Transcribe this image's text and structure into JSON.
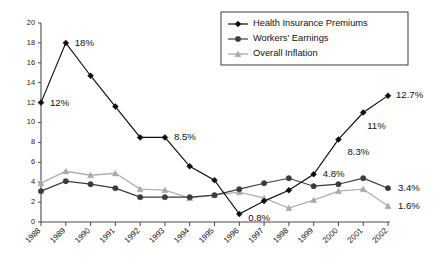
{
  "chart_data": {
    "type": "line",
    "title": "",
    "xlabel": "",
    "ylabel": "",
    "ylim": [
      0,
      20
    ],
    "ytick_step": 2,
    "grid": false,
    "legend_position": "top-right",
    "categories": [
      "1988",
      "1989",
      "1990",
      "1991",
      "1992",
      "1993",
      "1994",
      "1995",
      "1996",
      "1997",
      "1998",
      "1999",
      "2000",
      "2001",
      "2002"
    ],
    "yticks": [
      "0",
      "2",
      "4",
      "6",
      "8",
      "10",
      "12",
      "14",
      "16",
      "18",
      "20"
    ],
    "series": [
      {
        "name": "Health Insurance Premiums",
        "marker": "diamond",
        "color": "#0d0d0d",
        "values": [
          12,
          18,
          14.7,
          11.6,
          8.5,
          8.5,
          5.6,
          4.2,
          0.8,
          2.1,
          3.2,
          4.8,
          8.3,
          11,
          12.7
        ],
        "labels": [
          {
            "category": "1988",
            "value": 12,
            "text": "12%"
          },
          {
            "category": "1989",
            "value": 18,
            "text": "18%"
          },
          {
            "category": "1993",
            "value": 8.5,
            "text": "8.5%"
          },
          {
            "category": "1996",
            "value": 0.8,
            "text": "0.8%"
          },
          {
            "category": "1999",
            "value": 4.8,
            "text": "4.8%"
          },
          {
            "category": "2000",
            "value": 8.3,
            "text": "8.3%"
          },
          {
            "category": "2001",
            "value": 11,
            "text": "11%"
          },
          {
            "category": "2002",
            "value": 12.7,
            "text": "12.7%"
          }
        ]
      },
      {
        "name": "Workers' Earnings",
        "marker": "circle",
        "color": "#3b3b3b",
        "values": [
          3.1,
          4.1,
          3.8,
          3.4,
          2.5,
          2.5,
          2.5,
          2.7,
          3.3,
          3.9,
          4.4,
          3.6,
          3.8,
          4.4,
          3.4
        ],
        "labels": [
          {
            "category": "2002",
            "value": 3.4,
            "text": "3.4%"
          }
        ]
      },
      {
        "name": "Overall Inflation",
        "marker": "triangle",
        "color": "#a8a8a8",
        "values": [
          3.9,
          5.1,
          4.7,
          4.9,
          3.3,
          3.2,
          2.4,
          2.7,
          3.0,
          2.4,
          1.4,
          2.2,
          3.1,
          3.3,
          1.6
        ],
        "labels": [
          {
            "category": "2002",
            "value": 1.6,
            "text": "1.6%"
          }
        ]
      }
    ]
  },
  "legend": {
    "items": [
      {
        "label": "Health Insurance Premiums"
      },
      {
        "label": "Workers' Earnings"
      },
      {
        "label": "Overall Inflation"
      }
    ]
  }
}
